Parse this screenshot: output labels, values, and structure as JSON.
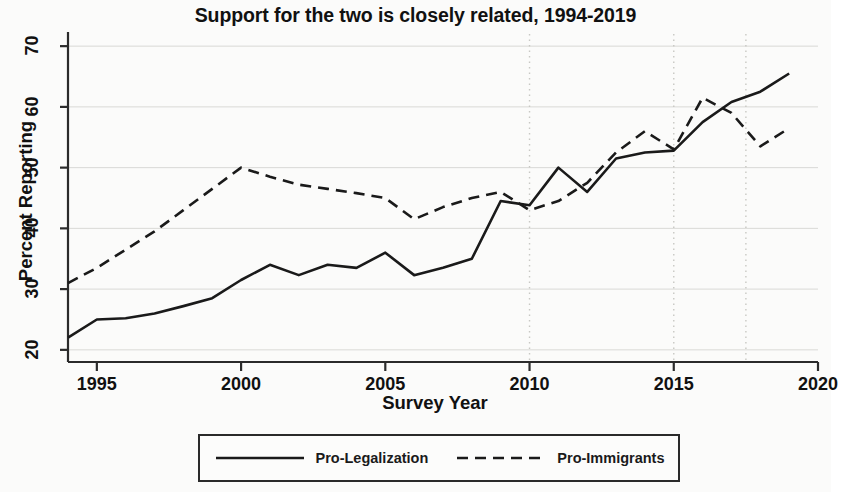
{
  "chart_data": {
    "type": "line",
    "title": "Support for the two is closely related, 1994-2019",
    "xlabel": "Survey Year",
    "ylabel": "Percent Reporting",
    "xlim": [
      1994,
      2020
    ],
    "ylim": [
      18,
      72
    ],
    "xticks": [
      1995,
      2000,
      2005,
      2010,
      2015,
      2020
    ],
    "xtick_labels": [
      "1995",
      "2000",
      "2005",
      "2010",
      "2015",
      "2020"
    ],
    "yticks": [
      20,
      30,
      40,
      50,
      60,
      70
    ],
    "ytick_labels": [
      "20",
      "30",
      "40",
      "50",
      "60",
      "70"
    ],
    "grid": "faint horizontal gridlines at y-ticks; dotted vertical gridlines",
    "vertical_gridlines": [
      2010,
      2015,
      2017.5
    ],
    "legend_position": "below axes, boxed, horizontal",
    "x": [
      1994,
      1995,
      1996,
      1997,
      1998,
      1999,
      2000,
      2001,
      2002,
      2003,
      2004,
      2005,
      2006,
      2007,
      2008,
      2009,
      2010,
      2011,
      2012,
      2013,
      2014,
      2015,
      2016,
      2017,
      2018,
      2019
    ],
    "series": [
      {
        "name": "Pro-Legalization",
        "style": "solid",
        "color": "#1a1a1a",
        "values": [
          22.0,
          25.0,
          25.2,
          26.0,
          27.2,
          28.5,
          31.5,
          34.0,
          32.3,
          34.0,
          33.5,
          36.0,
          32.3,
          33.5,
          35.0,
          44.5,
          43.8,
          50.0,
          46.0,
          51.5,
          52.5,
          52.8,
          57.5,
          60.8,
          62.5,
          65.5
        ]
      },
      {
        "name": "Pro-Immigrants",
        "style": "dashed",
        "color": "#1a1a1a",
        "values": [
          31.0,
          33.5,
          36.5,
          39.5,
          43.0,
          46.5,
          50.0,
          48.5,
          47.2,
          46.5,
          45.8,
          45.0,
          41.5,
          43.5,
          45.0,
          46.0,
          43.0,
          44.5,
          47.5,
          52.5,
          56.0,
          53.0,
          61.5,
          59.0,
          53.5,
          56.5
        ]
      }
    ]
  },
  "legend": {
    "items": [
      {
        "label": "Pro-Legalization",
        "style": "solid"
      },
      {
        "label": "Pro-Immigrants",
        "style": "dashed"
      }
    ]
  }
}
